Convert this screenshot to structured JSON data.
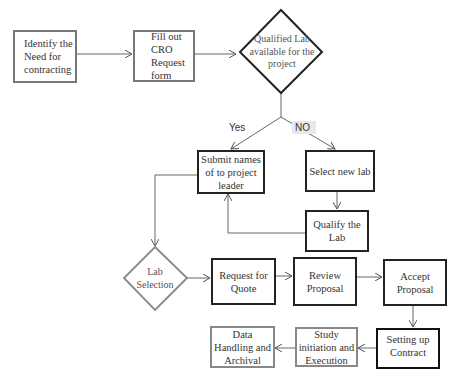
{
  "nodes": {
    "identify_need": "Identify the Need for contracting",
    "fill_cro": "Fill out CRO Request form",
    "qualified_lab": "Qualified Lab available for the project",
    "submit_names": "Submit names of to project leader",
    "select_new_lab": "Select new lab",
    "qualify_lab": "Qualify the Lab",
    "lab_selection": "Lab Selection",
    "request_quote": "Request for Quote",
    "review_proposal": "Review Proposal",
    "accept_proposal": "Accept Proposal",
    "setting_contract": "Setting up Contract",
    "study_initiation": "Study initiation and Execution",
    "data_handling": "Data Handling and Archival"
  },
  "edges": {
    "yes_label": "Yes",
    "no_label": "NO"
  },
  "colors": {
    "line": "#666666",
    "dark_border": "#222222",
    "gray_border": "#777777",
    "no_label_bg": "#e8e8e8"
  }
}
